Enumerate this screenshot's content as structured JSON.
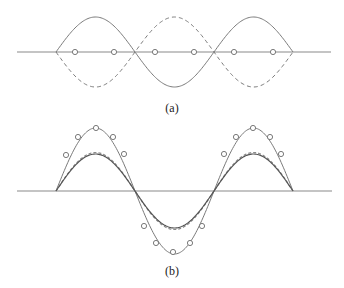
{
  "panel_a": {
    "label": "(a)",
    "axis": {
      "x1": 17,
      "x2": 331,
      "y": 52
    },
    "nodes_x": [
      56,
      135,
      214,
      293
    ],
    "amplitude": 35,
    "markers_x": [
      75,
      114,
      155,
      194,
      234,
      273
    ]
  },
  "panel_b": {
    "label": "(b)",
    "axis": {
      "x1": 17,
      "x2": 332,
      "y": 191
    },
    "nodes_x": [
      56,
      134,
      213,
      293
    ],
    "outer_amplitude": 63,
    "inner_amplitude": 37,
    "markers": [
      [
        66,
        155
      ],
      [
        78,
        137
      ],
      [
        96,
        128
      ],
      [
        113,
        137
      ],
      [
        124,
        154
      ],
      [
        144,
        226
      ],
      [
        156,
        243
      ],
      [
        173,
        252
      ],
      [
        190,
        243
      ],
      [
        202,
        226
      ],
      [
        224,
        154
      ],
      [
        236,
        137
      ],
      [
        253,
        128
      ],
      [
        270,
        137
      ],
      [
        281,
        154
      ]
    ]
  },
  "colors": {
    "line": "#7a7a7a",
    "axis": "#8a8a8a",
    "text": "#222222"
  }
}
